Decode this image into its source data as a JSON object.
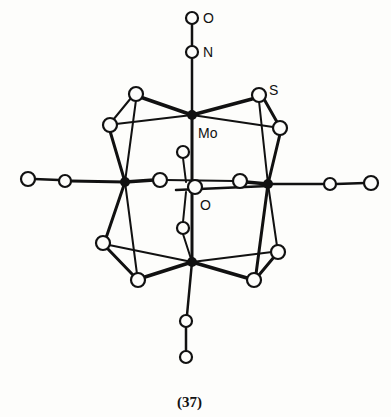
{
  "figure": {
    "caption": "(37)",
    "labels": {
      "oxygen_top": "O",
      "nitrogen": "N",
      "sulfur": "S",
      "molybdenum": "Mo",
      "oxygen_center": "O"
    }
  },
  "atoms": {
    "mo": [
      [
        192,
        115
      ],
      [
        125,
        182
      ],
      [
        268,
        184
      ],
      [
        192,
        262
      ]
    ],
    "s": [
      [
        136,
        94
      ],
      [
        259,
        95
      ],
      [
        110,
        125
      ],
      [
        280,
        128
      ],
      [
        103,
        243
      ],
      [
        138,
        280
      ],
      [
        254,
        280
      ],
      [
        278,
        252
      ]
    ],
    "ligand_c": [
      [
        65,
        181
      ],
      [
        330,
        184
      ],
      [
        160,
        180
      ],
      [
        240,
        181
      ],
      [
        183,
        152
      ],
      [
        183,
        228
      ],
      [
        186,
        321
      ]
    ],
    "ligand_o": [
      [
        28,
        179
      ],
      [
        371,
        183
      ],
      [
        186,
        357
      ]
    ],
    "nitrosyl": {
      "n": [
        192,
        52
      ],
      "o": [
        192,
        18
      ]
    },
    "center_o": [
      197,
      188
    ]
  },
  "colors": {
    "ink": "#111111",
    "background": "#fdfdfb"
  }
}
